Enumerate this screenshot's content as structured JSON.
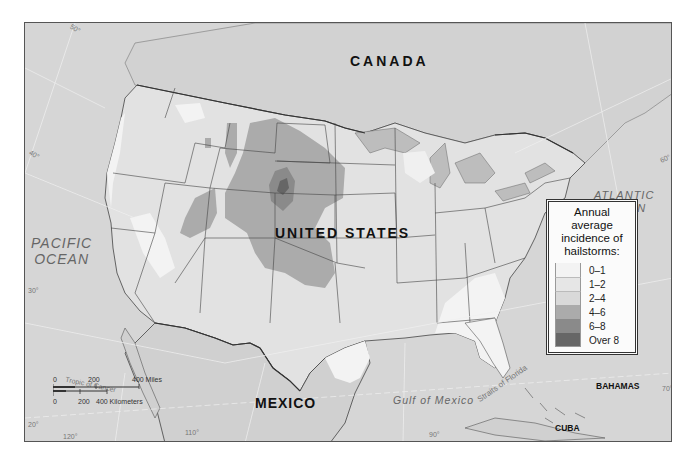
{
  "map": {
    "title": "Annual average incidence of hailstorms",
    "labels": {
      "canada": "CANADA",
      "united_states": "UNITED STATES",
      "mexico": "MEXICO",
      "pacific_ocean_line1": "PACIFIC",
      "pacific_ocean_line2": "OCEAN",
      "atlantic_ocean_line1": "ATLANTIC",
      "atlantic_ocean_line2": "OCEAN",
      "gulf_of_mexico": "Gulf of Mexico",
      "straits_of_florida": "Straits of Florida",
      "tropic_of_cancer": "Tropic of Cancer",
      "bahamas": "BAHAMAS",
      "cuba": "CUBA"
    },
    "graticule": {
      "lat_50": "50°",
      "lat_40": "40°",
      "lat_30": "30°",
      "lat_20": "20°",
      "lon_120": "120°",
      "lon_110": "110°",
      "lon_90": "90°",
      "lon_70": "70°",
      "lon_60": "60°"
    },
    "scale": {
      "miles_0": "0",
      "miles_200": "200",
      "miles_400": "400 Miles",
      "km_0": "0",
      "km_200": "200",
      "km_400": "400 Kilometers"
    }
  },
  "legend": {
    "title_line1": "Annual average",
    "title_line2": "incidence of",
    "title_line3": "hailstorms:",
    "items": [
      {
        "label": "0–1",
        "color": "#f3f3f3"
      },
      {
        "label": "1–2",
        "color": "#e6e6e6"
      },
      {
        "label": "2–4",
        "color": "#d9d9d9"
      },
      {
        "label": "4–6",
        "color": "#ababab"
      },
      {
        "label": "6–8",
        "color": "#8a8a8a"
      },
      {
        "label": "Over 8",
        "color": "#666666"
      }
    ]
  },
  "colors": {
    "ocean": "#d6d6d6",
    "land_foreign": "#d0d0d0",
    "band_0_1": "#f3f3f3",
    "band_1_2": "#e6e6e6",
    "band_2_4": "#dcdcdc",
    "band_4_6": "#ababab",
    "band_6_8": "#8a8a8a",
    "band_over_8": "#666666",
    "border": "#444444"
  }
}
